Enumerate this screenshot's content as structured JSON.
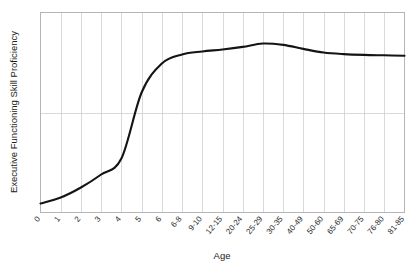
{
  "chart_data": {
    "type": "line",
    "title": "",
    "xlabel": "Age",
    "ylabel": "Executive Functioning Skill Proficiency",
    "grid": true,
    "legend": false,
    "legend_position": "none",
    "xlim": [
      0,
      18
    ],
    "ylim": [
      0,
      1
    ],
    "y_tick_labels": [],
    "y_gridlines": [
      0.5
    ],
    "categories": [
      "0",
      "1",
      "2",
      "3",
      "4",
      "5",
      "6",
      "6-8",
      "9-10",
      "12-15",
      "20-24",
      "25-29",
      "30-35",
      "40-49",
      "50-60",
      "65-69",
      "70-75",
      "76-80",
      "81-85"
    ],
    "series": [
      {
        "name": "Executive Functioning Skill Proficiency",
        "color": "#141414",
        "values": [
          0.045,
          0.075,
          0.125,
          0.19,
          0.27,
          0.6,
          0.745,
          0.79,
          0.805,
          0.815,
          0.828,
          0.845,
          0.838,
          0.818,
          0.8,
          0.792,
          0.788,
          0.786,
          0.784
        ]
      }
    ],
    "annotations": []
  },
  "axes": {
    "x_title": "Age",
    "y_title": "Executive Functioning Skill Proficiency"
  },
  "style": {
    "curve_color": "#141414",
    "grid_color": "#c9c9cf",
    "frame_color": "#b4b4ba",
    "background": "#ffffff",
    "text_color": "#1a1a1a"
  }
}
